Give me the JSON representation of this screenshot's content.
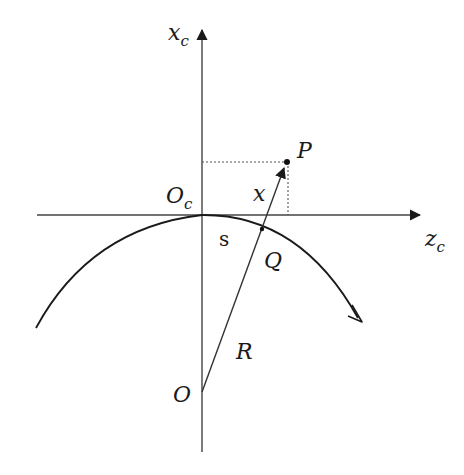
{
  "diagram": {
    "axes": {
      "vertical": {
        "label": "x",
        "subscript": "c"
      },
      "horizontal": {
        "label": "z",
        "subscript": "c"
      }
    },
    "points": {
      "origin_c": {
        "label": "O",
        "subscript": "c"
      },
      "origin": {
        "label": "O"
      },
      "P": {
        "label": "P"
      },
      "Q": {
        "label": "Q"
      }
    },
    "segments": {
      "x": {
        "label": "x"
      },
      "s": {
        "label": "s"
      },
      "R": {
        "label": "R"
      }
    },
    "colors": {
      "line": "#1a1a1a",
      "axis": "#444444",
      "dashed": "#555555"
    }
  }
}
